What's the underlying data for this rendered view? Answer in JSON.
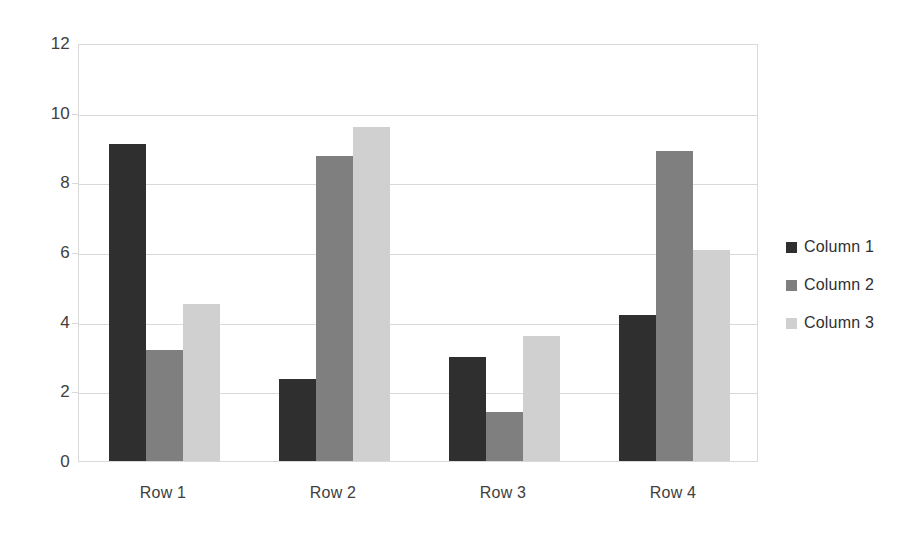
{
  "chart_data": {
    "type": "bar",
    "title": "",
    "subtitle": "",
    "xlabel": "",
    "ylabel": "",
    "categories": [
      "Row 1",
      "Row 2",
      "Row 3",
      "Row 4"
    ],
    "series": [
      {
        "name": "Column 1",
        "color": "#2f2f2f",
        "values": [
          9.1,
          2.35,
          3.0,
          4.2
        ]
      },
      {
        "name": "Column 2",
        "color": "#7f7f7f",
        "values": [
          3.2,
          8.75,
          1.4,
          8.9
        ]
      },
      {
        "name": "Column 3",
        "color": "#d0d0d0",
        "values": [
          4.5,
          9.6,
          3.6,
          6.05
        ]
      }
    ],
    "ylim": [
      0,
      12
    ],
    "yticks": [
      0,
      2,
      4,
      6,
      8,
      10,
      12
    ],
    "ytick_labels": [
      "0",
      "2",
      "4",
      "6",
      "8",
      "10",
      "12"
    ],
    "grid": true,
    "grid_axis": "y",
    "legend": true,
    "legend_position": "right",
    "plot_background": "#ffffff",
    "grid_color": "#d9d9d9",
    "text_color": "#404040"
  }
}
